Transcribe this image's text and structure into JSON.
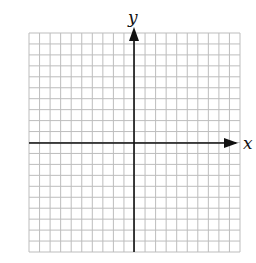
{
  "diagram": {
    "type": "coordinate-plane",
    "grid": {
      "columns": 20,
      "rows": 20,
      "left": 29,
      "top": 33,
      "right": 240,
      "bottom": 252,
      "line_color": "#bdbdbd",
      "background": "#ffffff"
    },
    "axes": {
      "origin_x": 134,
      "origin_y": 143,
      "color": "#111111",
      "x_axis": {
        "label": "x",
        "direction": "right",
        "arrow": true
      },
      "y_axis": {
        "label": "y",
        "direction": "up",
        "arrow": true
      }
    }
  }
}
